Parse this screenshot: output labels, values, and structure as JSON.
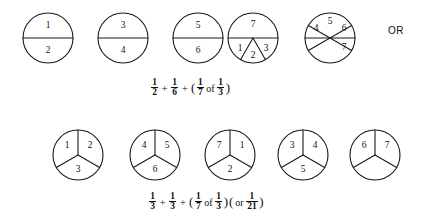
{
  "diagram": {
    "title_text": "",
    "connector_label": "OR",
    "stroke_color": "#1a1a1a",
    "background_color": "#ffffff",
    "rows": [
      {
        "row_name": "halves-and-sixths-row",
        "circles": [
          {
            "name": "circle-1-halves",
            "cx": 48,
            "cy": 38,
            "r": 25,
            "division": "halves-horizontal",
            "labels": [
              {
                "text": "1",
                "x": 48,
                "y": 26
              },
              {
                "text": "2",
                "x": 48,
                "y": 51
              }
            ]
          },
          {
            "name": "circle-2-halves",
            "cx": 123,
            "cy": 38,
            "r": 25,
            "division": "halves-horizontal",
            "labels": [
              {
                "text": "3",
                "x": 123,
                "y": 26
              },
              {
                "text": "4",
                "x": 123,
                "y": 51
              }
            ]
          },
          {
            "name": "circle-3-halves",
            "cx": 198,
            "cy": 38,
            "r": 25,
            "division": "halves-horizontal",
            "labels": [
              {
                "text": "5",
                "x": 198,
                "y": 26
              },
              {
                "text": "6",
                "x": 198,
                "y": 51
              }
            ]
          },
          {
            "name": "circle-4-half-and-thirds",
            "cx": 253,
            "cy": 38,
            "r": 25,
            "division": "top-half-plus-bottom-thirds",
            "labels": [
              {
                "text": "7",
                "x": 253,
                "y": 25
              },
              {
                "text": "1",
                "x": 240,
                "y": 49
              },
              {
                "text": "2",
                "x": 253,
                "y": 56
              },
              {
                "text": "3",
                "x": 266,
                "y": 49
              }
            ]
          },
          {
            "name": "circle-5-sixths",
            "cx": 330,
            "cy": 38,
            "r": 25,
            "division": "sixths",
            "labels": [
              {
                "text": "4",
                "x": 316,
                "y": 29
              },
              {
                "text": "5",
                "x": 330,
                "y": 22
              },
              {
                "text": "6",
                "x": 344,
                "y": 29
              },
              {
                "text": "7",
                "x": 344,
                "y": 48
              }
            ]
          }
        ]
      },
      {
        "row_name": "thirds-row",
        "circles": [
          {
            "name": "circle-6-thirds",
            "cx": 78,
            "cy": 155,
            "r": 25,
            "division": "thirds",
            "labels": [
              {
                "text": "1",
                "x": 67,
                "y": 146
              },
              {
                "text": "2",
                "x": 90,
                "y": 146
              },
              {
                "text": "3",
                "x": 78,
                "y": 170
              }
            ]
          },
          {
            "name": "circle-7-thirds",
            "cx": 155,
            "cy": 155,
            "r": 25,
            "division": "thirds",
            "labels": [
              {
                "text": "4",
                "x": 144,
                "y": 146
              },
              {
                "text": "5",
                "x": 167,
                "y": 146
              },
              {
                "text": "6",
                "x": 155,
                "y": 170
              }
            ]
          },
          {
            "name": "circle-8-thirds",
            "cx": 230,
            "cy": 155,
            "r": 25,
            "division": "thirds",
            "labels": [
              {
                "text": "7",
                "x": 219,
                "y": 146
              },
              {
                "text": "1",
                "x": 242,
                "y": 146
              },
              {
                "text": "2",
                "x": 230,
                "y": 170
              }
            ]
          },
          {
            "name": "circle-9-thirds",
            "cx": 303,
            "cy": 155,
            "r": 25,
            "division": "thirds",
            "labels": [
              {
                "text": "3",
                "x": 292,
                "y": 146
              },
              {
                "text": "4",
                "x": 315,
                "y": 146
              },
              {
                "text": "5",
                "x": 303,
                "y": 170
              }
            ]
          },
          {
            "name": "circle-10-thirds",
            "cx": 375,
            "cy": 155,
            "r": 25,
            "division": "thirds",
            "labels": [
              {
                "text": "6",
                "x": 364,
                "y": 146
              },
              {
                "text": "7",
                "x": 387,
                "y": 146
              }
            ]
          }
        ]
      }
    ]
  },
  "equations": {
    "top": {
      "name": "equation-halves-sixths",
      "terms": [
        {
          "type": "fraction",
          "num": "1",
          "den": "2"
        },
        {
          "type": "operator",
          "text": "+"
        },
        {
          "type": "fraction",
          "num": "1",
          "den": "6"
        },
        {
          "type": "operator",
          "text": "+"
        },
        {
          "type": "paren",
          "text": "("
        },
        {
          "type": "fraction",
          "num": "1",
          "den": "7"
        },
        {
          "type": "word",
          "text": "of"
        },
        {
          "type": "fraction",
          "num": "1",
          "den": "3"
        },
        {
          "type": "paren",
          "text": ")"
        }
      ],
      "plain_text": "1/2 + 1/6 + (1/7 of 1/3)"
    },
    "bottom": {
      "name": "equation-thirds",
      "terms": [
        {
          "type": "fraction",
          "num": "1",
          "den": "3"
        },
        {
          "type": "operator",
          "text": "+"
        },
        {
          "type": "fraction",
          "num": "1",
          "den": "3"
        },
        {
          "type": "operator",
          "text": "+"
        },
        {
          "type": "paren",
          "text": "("
        },
        {
          "type": "fraction",
          "num": "1",
          "den": "7"
        },
        {
          "type": "word",
          "text": "of"
        },
        {
          "type": "fraction",
          "num": "1",
          "den": "3"
        },
        {
          "type": "paren",
          "text": ")"
        },
        {
          "type": "paren",
          "text": "("
        },
        {
          "type": "word",
          "text": "or"
        },
        {
          "type": "fraction",
          "num": "1",
          "den": "21"
        },
        {
          "type": "paren",
          "text": ")"
        }
      ],
      "plain_text": "1/3 + 1/3 + (1/7 of 1/3) (or 1/21)"
    }
  }
}
